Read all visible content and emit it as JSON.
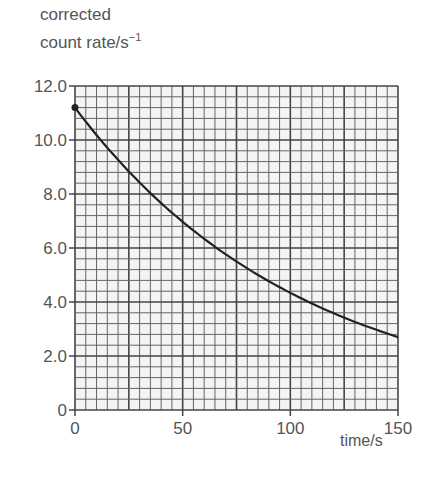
{
  "chart_data": {
    "type": "line",
    "title": "",
    "ylabel_line1": "corrected",
    "ylabel_line2": "count rate/s",
    "ylabel_sup": "−1",
    "xlabel": "time/s",
    "xlim": [
      0,
      150
    ],
    "ylim": [
      0,
      12.0
    ],
    "x_ticks": [
      "0",
      "50",
      "100",
      "150"
    ],
    "y_ticks": [
      "0",
      "2.0",
      "4.0",
      "6.0",
      "8.0",
      "10.0",
      "12.0"
    ],
    "grid": true,
    "grid_minor_x_step": 5,
    "grid_minor_y_step": 0.4,
    "legend": null,
    "series": [
      {
        "name": "corrected count rate",
        "x": [
          0,
          10,
          20,
          30,
          40,
          50,
          60,
          70,
          80,
          90,
          100,
          110,
          120,
          130,
          140,
          150
        ],
        "y": [
          11.2,
          10.2,
          9.3,
          8.5,
          7.8,
          7.1,
          6.5,
          5.9,
          5.4,
          4.9,
          4.5,
          4.1,
          3.7,
          3.4,
          3.1,
          2.7
        ]
      }
    ],
    "annotations": [
      "start point marked with dot at t=0, 11.2"
    ]
  }
}
